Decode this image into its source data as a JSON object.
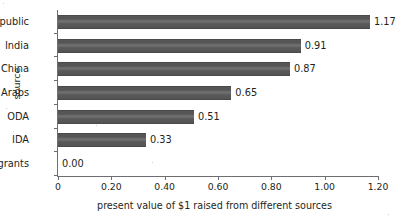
{
  "chart_data": {
    "type": "bar",
    "orientation": "horizontal",
    "title": "",
    "xlabel": "present value of $1 raised from different sources",
    "ylabel": "source",
    "categories": [
      "public",
      "India",
      "China",
      "Arabs",
      "ODA",
      "IDA",
      "grants"
    ],
    "values": [
      1.17,
      0.91,
      0.87,
      0.65,
      0.51,
      0.33,
      0.0
    ],
    "value_labels": [
      "1.17",
      "0.91",
      "0.87",
      "0.65",
      "0.51",
      "0.33",
      "0.00"
    ],
    "xlim": [
      0,
      1.2
    ],
    "xticks": [
      0,
      0.2,
      0.4,
      0.6,
      0.8,
      1.0,
      1.2
    ],
    "xtick_labels": [
      "0",
      "0.20",
      "0.40",
      "0.60",
      "0.80",
      "1.00",
      "1.20"
    ],
    "grid": false,
    "legend": null,
    "bar_color": "#5c5c5c",
    "axis_color": "#6d6e71",
    "text_color": "#231f20",
    "background": "#ffffff"
  }
}
